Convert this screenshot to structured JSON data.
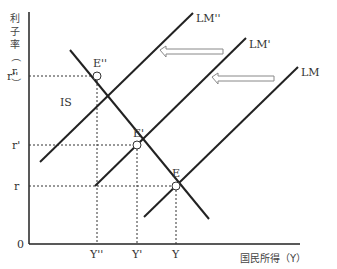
{
  "diagram": {
    "type": "IS-LM",
    "y_axis_label_chars": [
      "利",
      "子",
      "率",
      "（",
      "r",
      "）"
    ],
    "x_axis_label": "国民所得（Y）",
    "origin_label": "0",
    "curves": {
      "is": "IS",
      "lm": "LM",
      "lm_prime": "LM'",
      "lm_double_prime": "LM''"
    },
    "equilibria": {
      "e": "E",
      "e_prime": "E'",
      "e_double_prime": "E''"
    },
    "y_ticks": {
      "r": "r",
      "r_prime": "r'",
      "r_double_prime": "r''"
    },
    "x_ticks": {
      "y": "Y",
      "y_prime": "Y'",
      "y_double_prime": "Y''"
    },
    "shift_arrows": [
      "LM → LM'",
      "LM' → LM''"
    ],
    "colors": {
      "line": "#222222",
      "dashed": "#333333",
      "arrow_outline": "#888888"
    }
  }
}
